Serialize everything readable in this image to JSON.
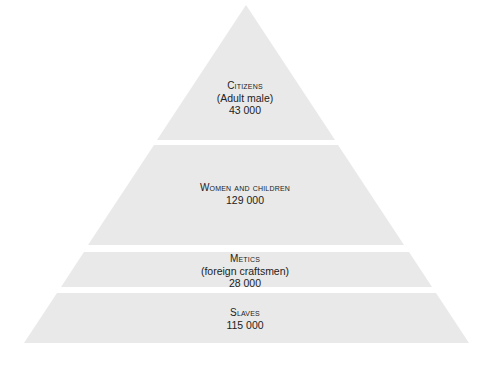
{
  "diagram": {
    "type": "pyramid",
    "fill_color": "#e9e9e9",
    "text_color": "#222222",
    "tiers": [
      {
        "title": "Citizens",
        "subtitle": "(Adult male)",
        "count": "43 000"
      },
      {
        "title": "Women and children",
        "subtitle": "",
        "count": "129 000"
      },
      {
        "title": "Metics",
        "subtitle": "(foreign craftsmen)",
        "count": "28 000"
      },
      {
        "title": "Slaves",
        "subtitle": "",
        "count": "115 000"
      }
    ]
  }
}
